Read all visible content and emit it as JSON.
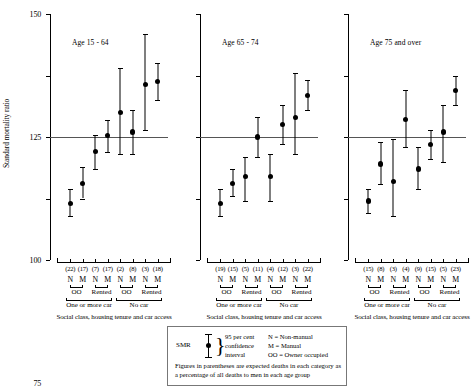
{
  "chart_data": {
    "type": "scatter",
    "title": "",
    "ylabel": "Standard mortality ratio",
    "xlabel": "Social class, housing tenure and car access",
    "ylim": [
      50,
      150
    ],
    "yticks": [
      50,
      75,
      100,
      125,
      150
    ],
    "ytick_labels": [
      "50",
      "75",
      "100",
      "125",
      "150"
    ],
    "reference_line": 100,
    "grid": false,
    "legend_position": "bottom-center",
    "categories": [
      "N",
      "M",
      "N",
      "M",
      "N",
      "M",
      "N",
      "M"
    ],
    "category_groups": [
      "OO",
      "OO",
      "Rented",
      "Rented",
      "OO",
      "OO",
      "Rented",
      "Rented"
    ],
    "supergroups": [
      "One or more car",
      "One or more car",
      "One or more car",
      "One or more car",
      "No car",
      "No car",
      "No car",
      "No car"
    ],
    "panels": [
      {
        "title": "Age 15 - 64",
        "expected_deaths": [
          "(22)",
          "(17)",
          "(7)",
          "(17)",
          "(2)",
          "(8)",
          "(3)",
          "(18)"
        ],
        "smr": [
          73,
          81,
          94,
          100.5,
          110,
          102,
          121.5,
          122.5
        ],
        "ci_low": [
          68,
          75,
          87,
          94,
          93,
          93,
          103,
          115
        ],
        "ci_high": [
          79,
          88,
          101,
          107,
          128,
          111,
          142,
          130
        ]
      },
      {
        "title": "Age 65 - 74",
        "expected_deaths": [
          "(19)",
          "(15)",
          "(5)",
          "(11)",
          "(4)",
          "(12)",
          "(3)",
          "(22)"
        ],
        "smr": [
          73,
          81,
          84,
          100,
          84,
          105,
          108,
          117
        ],
        "ci_low": [
          68,
          76,
          74,
          92,
          74,
          97,
          93,
          111
        ],
        "ci_high": [
          79,
          87,
          92,
          108,
          93,
          113,
          126,
          123
        ]
      },
      {
        "title": "Age 75 and over",
        "expected_deaths": [
          "(15)",
          "(8)",
          "(3)",
          "(4)",
          "(9)",
          "(15)",
          "(5)",
          "(23)"
        ],
        "smr": [
          74,
          89,
          82,
          107,
          87,
          97,
          102,
          119
        ],
        "ci_low": [
          69,
          81,
          68,
          96,
          79,
          91,
          90,
          113
        ],
        "ci_high": [
          79,
          98,
          99,
          119,
          96,
          103,
          113,
          125
        ]
      }
    ]
  },
  "axis": {
    "ylabel": "Standard mortality ratio",
    "xcaption": "Social class, housing tenure and car access",
    "tenure_labels": [
      "OO",
      "Rented",
      "OO",
      "Rented"
    ],
    "car_labels": [
      "One or more car",
      "No car"
    ]
  },
  "legend": {
    "smr_label": "SMR",
    "ci_lines": [
      "95 per cent",
      "confidence",
      "interval"
    ],
    "key_lines": [
      "N = Non-manual",
      "M = Manual",
      "OO = Owner occupied"
    ],
    "note": "Figures in parentheses are expected deaths in each category as a percentage of all deaths to men in each age group"
  }
}
